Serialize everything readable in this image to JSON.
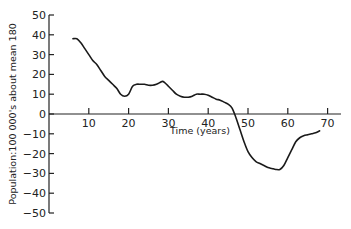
{
  "chart_data": {
    "type": "line",
    "title": "",
    "xlabel": "Time (years)",
    "ylabel": "Population:100 000's about mean 180",
    "xlim": [
      0,
      72
    ],
    "ylim": [
      -50,
      50
    ],
    "x_ticks": [
      10,
      20,
      30,
      40,
      50,
      60,
      70
    ],
    "x_tick_labels": [
      "10",
      "20",
      "30",
      "40",
      "50",
      "60",
      "70"
    ],
    "y_ticks": [
      50,
      40,
      30,
      20,
      10,
      0,
      -10,
      -20,
      -30,
      -40,
      -50
    ],
    "y_tick_labels": [
      "50",
      "40",
      "30",
      "20",
      "10",
      "0",
      "−10",
      "−20",
      "−30",
      "−40",
      "−50"
    ],
    "grid": false,
    "legend": "none",
    "series": [
      {
        "name": "Population deviation",
        "x": [
          6,
          7,
          8,
          9,
          10,
          11,
          12,
          13,
          14,
          15,
          16,
          17,
          18,
          19,
          20,
          21,
          22,
          23,
          24,
          25,
          26,
          27,
          28,
          28.5,
          29,
          30,
          31,
          32,
          33,
          34,
          35,
          36,
          37,
          38,
          39,
          40,
          41,
          42,
          43,
          44,
          45,
          46,
          47,
          48,
          49,
          50,
          51,
          52,
          53,
          54,
          55,
          56,
          57,
          58,
          59,
          60,
          61,
          62,
          63,
          64,
          65,
          66,
          67,
          68
        ],
        "values": [
          38,
          38,
          36,
          33,
          30,
          27,
          25,
          22,
          19,
          17,
          15,
          13,
          10,
          9,
          10,
          14,
          15,
          15,
          15,
          14.5,
          14.5,
          15,
          16,
          16.5,
          16,
          14,
          12,
          10,
          9,
          8.5,
          8.5,
          9,
          10,
          10,
          10,
          9.5,
          8.5,
          7.5,
          7,
          6,
          5,
          3,
          -2,
          -8,
          -14,
          -19,
          -22,
          -24,
          -25,
          -26,
          -27,
          -27.5,
          -28,
          -28,
          -26,
          -22,
          -18,
          -14,
          -12,
          -11,
          -10.5,
          -10,
          -9.5,
          -8.5
        ]
      }
    ]
  }
}
